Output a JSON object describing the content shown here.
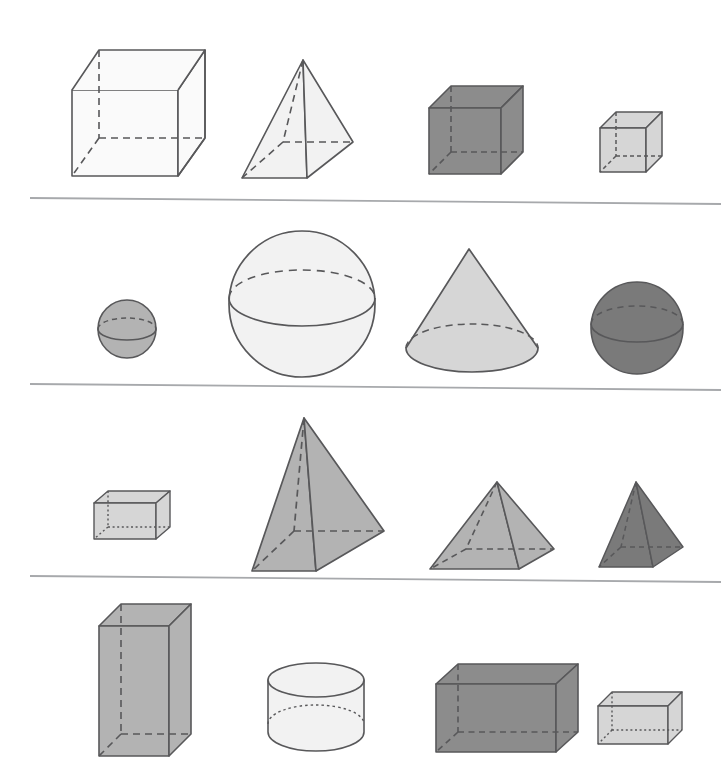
{
  "figure": {
    "background_color": "#ffffff",
    "outline_color": "#58585a",
    "divider_color": "#a7a9ac",
    "rows": 4,
    "columns": 4,
    "row_dividers_y": [
      201,
      387,
      580
    ],
    "palette": {
      "white": "#fafafa",
      "very_light_gray": "#f2f2f2",
      "light_gray": "#d6d6d6",
      "medium_gray": "#b3b3b3",
      "dark_gray": "#8c8c8c",
      "darker_gray": "#7a7a7a"
    },
    "rows_data": [
      {
        "row_index": 1,
        "label": "Row 1 — cubes and a square pyramid",
        "cells": [
          {
            "name": "large-cube",
            "solid": "cube",
            "size": "large",
            "fill": "#fafafa",
            "hidden_edges": "dashed"
          },
          {
            "name": "square-pyramid",
            "solid": "square-pyramid",
            "size": "large",
            "fill": "#f2f2f2",
            "hidden_edges": "dashed"
          },
          {
            "name": "medium-dark-cube",
            "solid": "cube",
            "size": "medium",
            "fill": "#8c8c8c",
            "hidden_edges": "dashed"
          },
          {
            "name": "small-light-cube",
            "solid": "cube",
            "size": "small",
            "fill": "#d6d6d6",
            "hidden_edges": "dashed"
          }
        ]
      },
      {
        "row_index": 2,
        "label": "Row 2 — spheres and a cone",
        "cells": [
          {
            "name": "small-sphere",
            "solid": "sphere",
            "size": "small",
            "fill": "#b3b3b3",
            "hidden_edges": "dashed"
          },
          {
            "name": "large-sphere",
            "solid": "sphere",
            "size": "large",
            "fill": "#f2f2f2",
            "hidden_edges": "dashed"
          },
          {
            "name": "cone",
            "solid": "cone",
            "size": "large",
            "fill": "#d6d6d6",
            "hidden_edges": "dashed"
          },
          {
            "name": "dark-sphere",
            "solid": "sphere",
            "size": "medium",
            "fill": "#7a7a7a",
            "hidden_edges": "dashed"
          }
        ]
      },
      {
        "row_index": 3,
        "label": "Row 3 — a rectangular prism and pyramids",
        "cells": [
          {
            "name": "small-rectangular-prism",
            "solid": "rectangular-prism",
            "size": "small",
            "fill": "#d6d6d6",
            "hidden_edges": "dotted"
          },
          {
            "name": "tall-square-pyramid",
            "solid": "square-pyramid",
            "size": "tall",
            "fill": "#b3b3b3",
            "hidden_edges": "dashed"
          },
          {
            "name": "wide-square-pyramid",
            "solid": "square-pyramid",
            "size": "wide",
            "fill": "#b3b3b3",
            "hidden_edges": "dashed"
          },
          {
            "name": "small-dark-pyramid",
            "solid": "square-pyramid",
            "size": "small",
            "fill": "#7a7a7a",
            "hidden_edges": "dashed"
          }
        ]
      },
      {
        "row_index": 4,
        "label": "Row 4 — prisms and a cylinder",
        "cells": [
          {
            "name": "tall-rectangular-prism",
            "solid": "rectangular-prism",
            "size": "tall",
            "fill": "#b3b3b3",
            "hidden_edges": "dashed"
          },
          {
            "name": "cylinder",
            "solid": "cylinder",
            "size": "medium",
            "fill": "#f2f2f2",
            "hidden_edges": "dotted"
          },
          {
            "name": "wide-dark-prism",
            "solid": "rectangular-prism",
            "size": "wide",
            "fill": "#8c8c8c",
            "hidden_edges": "dashed"
          },
          {
            "name": "small-light-prism",
            "solid": "rectangular-prism",
            "size": "small",
            "fill": "#d6d6d6",
            "hidden_edges": "dotted"
          }
        ]
      }
    ]
  }
}
